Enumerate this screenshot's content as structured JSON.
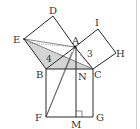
{
  "figure": {
    "type": "geometry-pythagorean-proof",
    "points": {
      "A": "A",
      "B": "B",
      "C": "C",
      "D": "D",
      "E": "E",
      "F": "F",
      "G": "G",
      "H": "H",
      "I": "I",
      "M": "M",
      "N": "N"
    },
    "side_labels": {
      "AB": "4",
      "AC": "3"
    },
    "shaded_region": "triangle EBC",
    "shade_color": "#d4d4d4",
    "line_color": "#2a2a2a"
  }
}
